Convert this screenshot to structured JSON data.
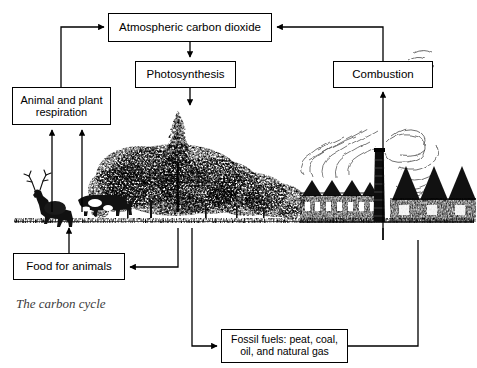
{
  "diagram": {
    "caption": "The carbon cycle",
    "boxes": {
      "atmosphere": {
        "label": "Atmospheric carbon dioxide",
        "x": 108,
        "y": 13,
        "w": 164,
        "h": 29,
        "font": 11.5
      },
      "photosynthesis": {
        "label": "Photosynthesis",
        "x": 135,
        "y": 61,
        "w": 101,
        "h": 27,
        "font": 11.5
      },
      "respiration": {
        "line1": "Animal and plant",
        "line2": "respiration",
        "x": 12,
        "y": 87,
        "w": 99,
        "h": 38,
        "font": 11
      },
      "combustion": {
        "label": "Combustion",
        "x": 333,
        "y": 61,
        "w": 100,
        "h": 27,
        "font": 11.5
      },
      "food": {
        "label": "Food for animals",
        "x": 13,
        "y": 253,
        "w": 112,
        "h": 27,
        "font": 11.5
      },
      "fossil": {
        "line1": "Fossil fuels: peat, coal,",
        "line2": "oil, and natural gas",
        "x": 221,
        "y": 329,
        "w": 127,
        "h": 34,
        "font": 10.5
      }
    },
    "arrows": [
      {
        "name": "respiration-to-atmosphere",
        "from": "Animal and plant respiration",
        "to": "Atmospheric carbon dioxide"
      },
      {
        "name": "atmosphere-to-photosynthesis",
        "from": "Atmospheric carbon dioxide",
        "to": "Photosynthesis"
      },
      {
        "name": "photosynthesis-to-plants",
        "from": "Photosynthesis",
        "to": "Plants"
      },
      {
        "name": "combustion-to-atmosphere",
        "from": "Combustion",
        "to": "Atmospheric carbon dioxide"
      },
      {
        "name": "fossil-fuels-to-combustion",
        "from": "Fossil fuels: peat, coal, oil, and natural gas",
        "to": "Combustion"
      },
      {
        "name": "animals-to-respiration",
        "from": "Animals",
        "to": "Animal and plant respiration"
      },
      {
        "name": "plants-to-respiration",
        "from": "Plants",
        "to": "Animal and plant respiration"
      },
      {
        "name": "food-to-animals",
        "from": "Food for animals",
        "to": "Animals"
      },
      {
        "name": "plants-to-food",
        "from": "Plants",
        "to": "Food for animals"
      },
      {
        "name": "plants-to-fossil-fuels",
        "from": "Plants",
        "to": "Fossil fuels: peat, coal, oil, and natural gas"
      }
    ],
    "illustrations": [
      {
        "name": "deer-illustration",
        "label": "deer"
      },
      {
        "name": "cow-illustration",
        "label": "cow"
      },
      {
        "name": "trees-illustration",
        "label": "trees and forest"
      },
      {
        "name": "factory-illustration",
        "label": "factory with smokestack and smoke"
      },
      {
        "name": "ground-line",
        "label": "ground"
      }
    ],
    "colors": {
      "ink": "#000000",
      "paper": "#ffffff",
      "caption": "#3b3b3b"
    }
  }
}
